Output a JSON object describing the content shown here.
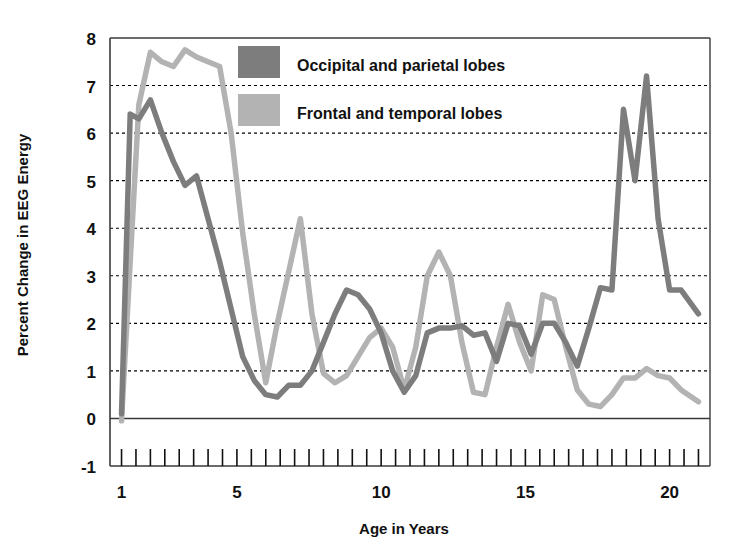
{
  "chart_data": {
    "type": "line",
    "title": "",
    "xlabel": "Age in Years",
    "ylabel": "Percent Change in EEG Energy",
    "xlim": [
      0.6,
      21.4
    ],
    "ylim": [
      -1,
      8
    ],
    "grid": true,
    "grid_axis": "y",
    "legend_position": "top-center",
    "y_ticks": [
      -1,
      0,
      1,
      2,
      3,
      4,
      5,
      6,
      7,
      8
    ],
    "y_tick_labels": [
      "-1",
      "0",
      "1",
      "2",
      "3",
      "4",
      "5",
      "6",
      "7",
      "8"
    ],
    "x_ticks": [
      1,
      5,
      10,
      15,
      20
    ],
    "x_tick_labels": [
      "1",
      "5",
      "10",
      "15",
      "20"
    ],
    "x_minor_tick_step": 0.5,
    "colors": {
      "occipital_parietal": "#7d7d7d",
      "frontal_temporal": "#b3b3b3",
      "axis": "#3a3a3a",
      "text": "#111111",
      "background": "#ffffff"
    },
    "series": [
      {
        "name": "Occipital and parietal lobes",
        "color": "#7d7d7d",
        "x": [
          1.0,
          1.3,
          1.6,
          2.0,
          2.4,
          2.8,
          3.2,
          3.6,
          4.0,
          4.4,
          4.8,
          5.2,
          5.6,
          6.0,
          6.4,
          6.8,
          7.2,
          7.6,
          8.0,
          8.4,
          8.8,
          9.2,
          9.6,
          10.0,
          10.4,
          10.8,
          11.2,
          11.6,
          12.0,
          12.4,
          12.8,
          13.2,
          13.6,
          14.0,
          14.4,
          14.8,
          15.2,
          15.6,
          16.0,
          16.4,
          16.8,
          17.2,
          17.6,
          18.0,
          18.4,
          18.8,
          19.2,
          19.6,
          20.0,
          20.4,
          21.0
        ],
        "y": [
          0.1,
          6.4,
          6.3,
          6.7,
          6.0,
          5.4,
          4.9,
          5.1,
          4.2,
          3.3,
          2.3,
          1.3,
          0.8,
          0.5,
          0.45,
          0.7,
          0.7,
          1.0,
          1.6,
          2.2,
          2.7,
          2.6,
          2.3,
          1.8,
          1.0,
          0.55,
          0.9,
          1.8,
          1.9,
          1.9,
          1.95,
          1.75,
          1.8,
          1.2,
          2.0,
          1.95,
          1.35,
          2.0,
          2.0,
          1.6,
          1.1,
          1.9,
          2.75,
          2.7,
          6.5,
          5.0,
          7.2,
          4.2,
          2.7,
          2.7,
          2.2
        ]
      },
      {
        "name": "Frontal and temporal lobes",
        "color": "#b3b3b3",
        "x": [
          1.0,
          1.3,
          1.6,
          2.0,
          2.4,
          2.8,
          3.2,
          3.6,
          4.0,
          4.4,
          4.8,
          5.2,
          5.6,
          6.0,
          6.4,
          6.8,
          7.2,
          7.6,
          8.0,
          8.4,
          8.8,
          9.2,
          9.6,
          10.0,
          10.4,
          10.8,
          11.2,
          11.6,
          12.0,
          12.4,
          12.8,
          13.2,
          13.6,
          14.0,
          14.4,
          14.8,
          15.2,
          15.6,
          16.0,
          16.4,
          16.8,
          17.2,
          17.6,
          18.0,
          18.4,
          18.8,
          19.2,
          19.6,
          20.0,
          20.4,
          21.0
        ],
        "y": [
          -0.05,
          3.3,
          6.6,
          7.7,
          7.5,
          7.4,
          7.75,
          7.6,
          7.5,
          7.4,
          6.0,
          3.9,
          2.2,
          0.75,
          2.0,
          3.1,
          4.2,
          2.2,
          0.95,
          0.75,
          0.9,
          1.3,
          1.7,
          1.9,
          1.5,
          0.6,
          1.5,
          3.0,
          3.5,
          3.0,
          1.6,
          0.55,
          0.5,
          1.5,
          2.4,
          1.6,
          1.0,
          2.6,
          2.5,
          1.5,
          0.6,
          0.3,
          0.25,
          0.5,
          0.85,
          0.85,
          1.05,
          0.9,
          0.85,
          0.6,
          0.35
        ]
      }
    ]
  },
  "legend": {
    "entries": [
      {
        "label": "Occipital and parietal lobes",
        "color": "#7d7d7d"
      },
      {
        "label": "Frontal and temporal lobes",
        "color": "#b3b3b3"
      }
    ]
  },
  "axes": {
    "x_title": "Age in Years",
    "y_title": "Percent Change in EEG Energy"
  }
}
